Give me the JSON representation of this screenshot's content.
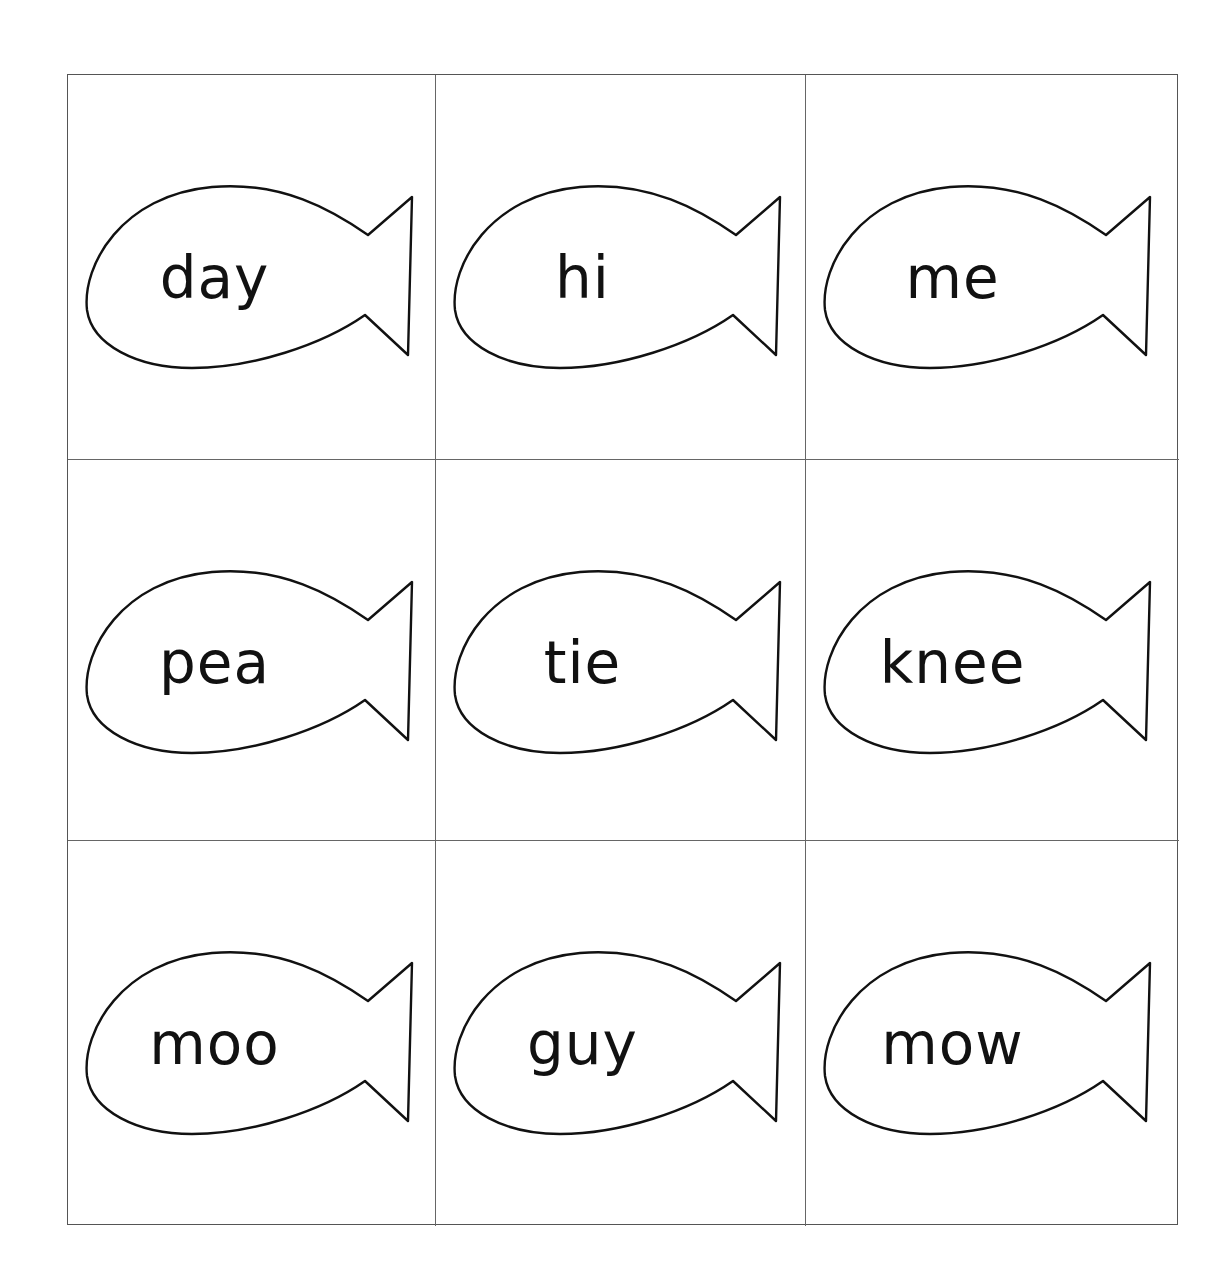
{
  "worksheet": {
    "cards": [
      {
        "word": "day",
        "shape": "fish-icon"
      },
      {
        "word": "hi",
        "shape": "fish-icon"
      },
      {
        "word": "me",
        "shape": "fish-icon"
      },
      {
        "word": "pea",
        "shape": "fish-icon"
      },
      {
        "word": "tie",
        "shape": "fish-icon"
      },
      {
        "word": "knee",
        "shape": "fish-icon"
      },
      {
        "word": "moo",
        "shape": "fish-icon"
      },
      {
        "word": "guy",
        "shape": "fish-icon"
      },
      {
        "word": "mow",
        "shape": "fish-icon"
      }
    ],
    "colors": {
      "outline": "#111111",
      "grid": "#666666",
      "background": "#ffffff"
    }
  }
}
